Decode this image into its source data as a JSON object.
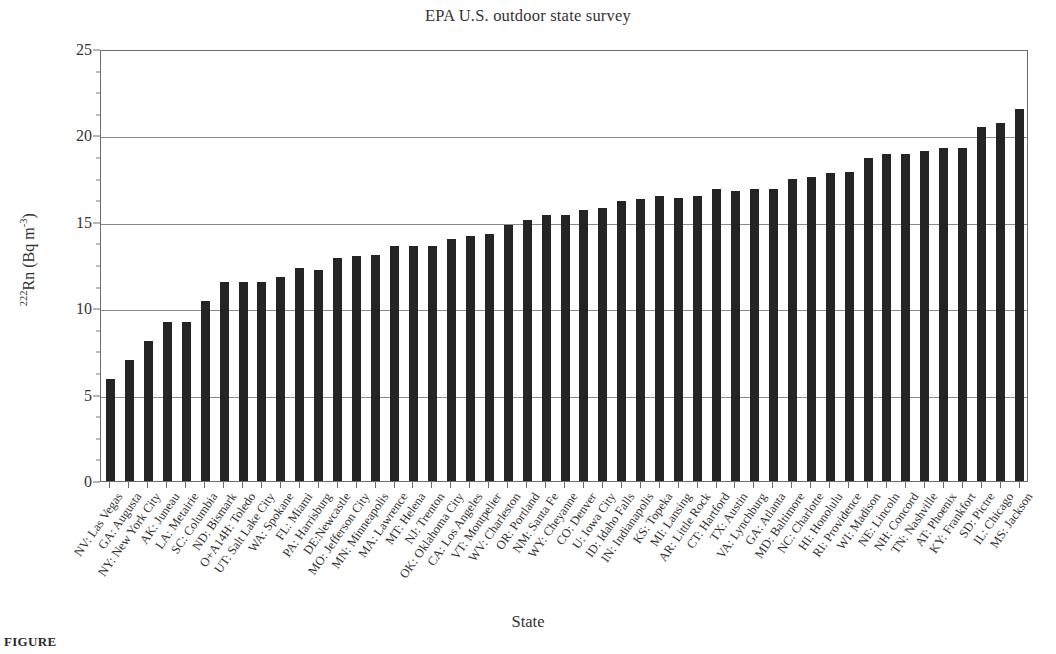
{
  "chart_data": {
    "type": "bar",
    "title": "EPA U.S. outdoor state survey",
    "xlabel": "State",
    "ylabel": "222Rn (Bq m-3)",
    "ylabel_parts": {
      "superscript_prefix": "222",
      "base": "Rn (Bq m",
      "exponent": "-3",
      "suffix": ")"
    },
    "ylim": [
      0,
      25
    ],
    "yticks": [
      0,
      5,
      10,
      15,
      20,
      25
    ],
    "ytick_labels": [
      "0",
      "5",
      "10",
      "15",
      "20",
      "25"
    ],
    "ytick_minor_step": 1.25,
    "grid": true,
    "grid_axis": "y",
    "legend": null,
    "bar_color": "#242424",
    "categories": [
      "NV: Las Vegas",
      "GA: Augusta",
      "NY: New York City",
      "AK: Juneau",
      "LA: Metairie",
      "SC: Columbia",
      "ND: Bismark",
      "O+A14H: Toledo",
      "UT: Salt Lake City",
      "WA: Spokane",
      "FL: Miami",
      "PA: Harrisburg",
      "DE:Newcastle",
      "MO: Jefferson City",
      "MN: Minneapolis",
      "MA: Lawrence",
      "MT: Helena",
      "NJ: Trenton",
      "OK: Oklahoma City",
      "CA: Los Angeles",
      "VT: Montpelier",
      "WV: Charleston",
      "OR: Portland",
      "NM: Santa Fe",
      "WY: Cheyanne",
      "CO: Denver",
      "U: Iowa City",
      "ID: Idaho Falls",
      "IN: Indianapolis",
      "KS: Topeka",
      "MI: Lansing",
      "AR: Little Rock",
      "CT: Hartford",
      "TX: Austin",
      "VA: Lynchburg",
      "GA: Atlanta",
      "MD: Baltimore",
      "NC: Charlotte",
      "HI: Honolulu",
      "RI: Providence",
      "WI: Madison",
      "NE: Lincoln",
      "NH: Concord",
      "TN: Nashville",
      "AT: Phoenix",
      "KY: Frankfort",
      "SD: Pictre",
      "IL: Chicago",
      "MS: Jackson"
    ],
    "values": [
      5.9,
      7.0,
      8.1,
      9.2,
      9.2,
      10.4,
      11.5,
      11.5,
      11.5,
      11.8,
      12.3,
      12.2,
      12.9,
      13.0,
      13.1,
      13.6,
      13.6,
      13.6,
      14.0,
      14.2,
      14.3,
      14.8,
      15.1,
      15.4,
      15.4,
      15.7,
      15.8,
      16.2,
      16.3,
      16.5,
      16.4,
      16.5,
      16.9,
      16.8,
      16.9,
      16.9,
      17.5,
      17.6,
      17.8,
      17.9,
      18.7,
      18.9,
      18.9,
      19.1,
      19.3,
      19.3,
      20.5,
      20.7,
      21.5
    ]
  },
  "caption": "FIGURE"
}
